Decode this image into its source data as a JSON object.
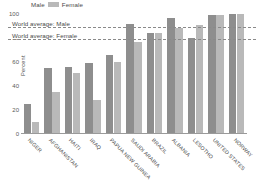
{
  "legend": {
    "male_label": "Male",
    "female_label": "Female",
    "male_color": "#8e8e8e",
    "female_color": "#b9b9b9"
  },
  "axis": {
    "ylabel": "Percent",
    "yticks": [
      "0",
      "20",
      "40",
      "60",
      "80",
      "100"
    ],
    "ymin": 0,
    "ymax": 100
  },
  "reference_lines": [
    {
      "label": "World average: Male",
      "value": 89,
      "value_text": "8"
    },
    {
      "label": "World average: Female",
      "value": 79,
      "value_text": "7"
    }
  ],
  "chart_data": {
    "type": "bar",
    "title": "",
    "xlabel": "",
    "ylabel": "Percent",
    "ylim": [
      0,
      100
    ],
    "grid": false,
    "legend_position": "top-left",
    "categories": [
      "NIGER",
      "AFGHANISTAN",
      "HAITI",
      "IRAQ",
      "PAPUA NEW GUINEA",
      "SAUDI ARABIA",
      "BRAZIL",
      "ALBANIA",
      "LESOTHO",
      "UNITED STATES",
      "NORWAY"
    ],
    "series": [
      {
        "name": "Male",
        "color": "#8e8e8e",
        "values": [
          25,
          55,
          56,
          59,
          66,
          92,
          84,
          97,
          80,
          99,
          100
        ]
      },
      {
        "name": "Female",
        "color": "#b9b9b9",
        "values": [
          10,
          35,
          51,
          28,
          60,
          77,
          84,
          88,
          91,
          99,
          100
        ]
      }
    ],
    "annotations": [
      {
        "text": "World average: Male",
        "y": 89
      },
      {
        "text": "World average: Female",
        "y": 79
      }
    ]
  }
}
